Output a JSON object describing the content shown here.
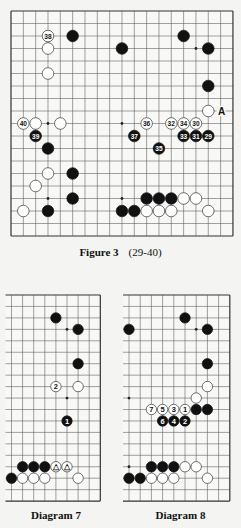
{
  "colors": {
    "background": "#f4f4f2",
    "board_bg": "#f8f8f6",
    "grid_line": "#555555",
    "border_line": "#333333",
    "black_stone": "#111111",
    "white_stone": "#ffffff",
    "white_outline": "#333333"
  },
  "figure3": {
    "caption_title": "Figure 3",
    "caption_range": "(29-40)",
    "board": {
      "cols": 19,
      "rows": 19,
      "origin_x": 11,
      "origin_y": 11,
      "dx": 12.33,
      "dy": 12.5,
      "stone_r": 5.8,
      "borders": {
        "top": true,
        "bottom": true,
        "left": true,
        "right": true
      },
      "star_points": [
        [
          3,
          3
        ],
        [
          9,
          3
        ],
        [
          15,
          3
        ],
        [
          3,
          9
        ],
        [
          9,
          9
        ],
        [
          15,
          9
        ],
        [
          3,
          15
        ],
        [
          9,
          15
        ],
        [
          15,
          15
        ]
      ],
      "stones": [
        {
          "c": 3,
          "r": 2,
          "color": "white",
          "label": "38"
        },
        {
          "c": 5,
          "r": 2,
          "color": "black"
        },
        {
          "c": 14,
          "r": 2,
          "color": "black"
        },
        {
          "c": 3,
          "r": 3,
          "color": "white"
        },
        {
          "c": 9,
          "r": 3,
          "color": "black"
        },
        {
          "c": 16,
          "r": 3,
          "color": "black"
        },
        {
          "c": 3,
          "r": 5,
          "color": "white"
        },
        {
          "c": 16,
          "r": 6,
          "color": "black"
        },
        {
          "c": 16,
          "r": 8,
          "color": "white"
        },
        {
          "c": 1,
          "r": 9,
          "color": "white",
          "label": "40"
        },
        {
          "c": 2,
          "r": 9,
          "color": "white"
        },
        {
          "c": 4,
          "r": 9,
          "color": "white"
        },
        {
          "c": 11,
          "r": 9,
          "color": "white",
          "label": "36"
        },
        {
          "c": 13,
          "r": 9,
          "color": "white",
          "label": "32"
        },
        {
          "c": 14,
          "r": 9,
          "color": "white",
          "label": "34"
        },
        {
          "c": 15,
          "r": 9,
          "color": "white",
          "label": "30"
        },
        {
          "c": 2,
          "r": 10,
          "color": "black",
          "label": "39"
        },
        {
          "c": 10,
          "r": 10,
          "color": "black",
          "label": "37"
        },
        {
          "c": 14,
          "r": 10,
          "color": "black",
          "label": "33"
        },
        {
          "c": 15,
          "r": 10,
          "color": "black",
          "label": "31"
        },
        {
          "c": 16,
          "r": 10,
          "color": "black",
          "label": "29"
        },
        {
          "c": 3,
          "r": 11,
          "color": "black"
        },
        {
          "c": 12,
          "r": 11,
          "color": "black",
          "label": "35"
        },
        {
          "c": 3,
          "r": 13,
          "color": "white"
        },
        {
          "c": 5,
          "r": 13,
          "color": "black"
        },
        {
          "c": 2,
          "r": 14,
          "color": "white"
        },
        {
          "c": 5,
          "r": 15,
          "color": "black"
        },
        {
          "c": 11,
          "r": 15,
          "color": "black"
        },
        {
          "c": 12,
          "r": 15,
          "color": "black"
        },
        {
          "c": 13,
          "r": 15,
          "color": "black"
        },
        {
          "c": 14,
          "r": 15,
          "color": "white"
        },
        {
          "c": 15,
          "r": 15,
          "color": "white"
        },
        {
          "c": 1,
          "r": 16,
          "color": "white"
        },
        {
          "c": 3,
          "r": 16,
          "color": "black"
        },
        {
          "c": 9,
          "r": 16,
          "color": "black"
        },
        {
          "c": 10,
          "r": 16,
          "color": "black"
        },
        {
          "c": 11,
          "r": 16,
          "color": "white"
        },
        {
          "c": 12,
          "r": 16,
          "color": "white"
        },
        {
          "c": 13,
          "r": 16,
          "color": "white"
        },
        {
          "c": 16,
          "r": 16,
          "color": "white"
        }
      ],
      "letters": [
        {
          "c": 17,
          "r": 8,
          "text": "A"
        }
      ]
    }
  },
  "diagram7": {
    "caption": "Diagram 7",
    "board": {
      "cols": 9,
      "rows": 19,
      "origin_x": 11.5,
      "origin_y": 295,
      "dx": 11.1,
      "dy": 11.45,
      "stone_r": 5.2,
      "left_extend": 6,
      "borders": {
        "top": true,
        "bottom": true,
        "left": false,
        "right": true
      },
      "star_points": [
        [
          5,
          3
        ],
        [
          5,
          9
        ],
        [
          5,
          15
        ]
      ],
      "stones": [
        {
          "c": 4,
          "r": 2,
          "color": "black"
        },
        {
          "c": 6,
          "r": 3,
          "color": "black"
        },
        {
          "c": 6,
          "r": 6,
          "color": "black"
        },
        {
          "c": 4,
          "r": 8,
          "color": "white",
          "label": "2"
        },
        {
          "c": 6,
          "r": 8,
          "color": "white"
        },
        {
          "c": 5,
          "r": 11,
          "color": "black",
          "label": "1"
        },
        {
          "c": 1,
          "r": 15,
          "color": "black"
        },
        {
          "c": 2,
          "r": 15,
          "color": "black"
        },
        {
          "c": 3,
          "r": 15,
          "color": "black"
        },
        {
          "c": 4,
          "r": 15,
          "color": "white",
          "label": "△"
        },
        {
          "c": 5,
          "r": 15,
          "color": "white",
          "label": "△"
        },
        {
          "c": 0,
          "r": 16,
          "color": "black"
        },
        {
          "c": 1,
          "r": 16,
          "color": "white"
        },
        {
          "c": 2,
          "r": 16,
          "color": "white"
        },
        {
          "c": 3,
          "r": 16,
          "color": "white"
        },
        {
          "c": 6,
          "r": 16,
          "color": "white"
        }
      ],
      "letters": []
    }
  },
  "diagram8": {
    "caption": "Diagram 8",
    "board": {
      "cols": 10,
      "rows": 19,
      "origin_x": 129,
      "origin_y": 295,
      "dx": 11.2,
      "dy": 11.45,
      "stone_r": 5.2,
      "left_extend": 6,
      "borders": {
        "top": true,
        "bottom": true,
        "left": false,
        "right": true
      },
      "star_points": [
        [
          0,
          3
        ],
        [
          6,
          3
        ],
        [
          0,
          9
        ],
        [
          6,
          9
        ],
        [
          0,
          15
        ],
        [
          6,
          15
        ]
      ],
      "stones": [
        {
          "c": 5,
          "r": 2,
          "color": "black"
        },
        {
          "c": 0,
          "r": 3,
          "color": "black"
        },
        {
          "c": 7,
          "r": 3,
          "color": "black"
        },
        {
          "c": 7,
          "r": 6,
          "color": "black"
        },
        {
          "c": 7,
          "r": 8,
          "color": "white"
        },
        {
          "c": 6,
          "r": 9,
          "color": "white"
        },
        {
          "c": 2,
          "r": 10,
          "color": "white",
          "label": "7"
        },
        {
          "c": 3,
          "r": 10,
          "color": "white",
          "label": "5"
        },
        {
          "c": 4,
          "r": 10,
          "color": "white",
          "label": "3"
        },
        {
          "c": 5,
          "r": 10,
          "color": "white",
          "label": "1"
        },
        {
          "c": 6,
          "r": 10,
          "color": "black"
        },
        {
          "c": 7,
          "r": 10,
          "color": "black"
        },
        {
          "c": 3,
          "r": 11,
          "color": "black",
          "label": "6"
        },
        {
          "c": 4,
          "r": 11,
          "color": "black",
          "label": "4"
        },
        {
          "c": 5,
          "r": 11,
          "color": "black",
          "label": "2"
        },
        {
          "c": 2,
          "r": 15,
          "color": "black"
        },
        {
          "c": 3,
          "r": 15,
          "color": "black"
        },
        {
          "c": 4,
          "r": 15,
          "color": "black"
        },
        {
          "c": 5,
          "r": 15,
          "color": "white"
        },
        {
          "c": 6,
          "r": 15,
          "color": "white"
        },
        {
          "c": 0,
          "r": 16,
          "color": "black"
        },
        {
          "c": 1,
          "r": 16,
          "color": "black"
        },
        {
          "c": 2,
          "r": 16,
          "color": "white"
        },
        {
          "c": 3,
          "r": 16,
          "color": "white"
        },
        {
          "c": 4,
          "r": 16,
          "color": "white"
        },
        {
          "c": 7,
          "r": 16,
          "color": "white"
        }
      ],
      "letters": []
    }
  }
}
